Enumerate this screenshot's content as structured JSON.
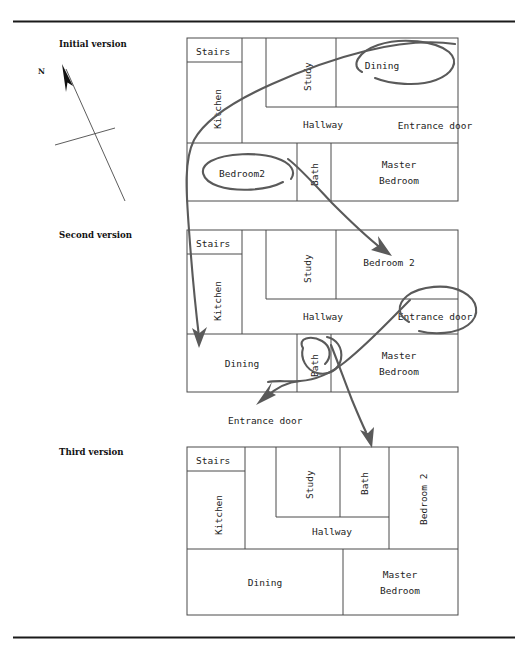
{
  "figure": {
    "compass": {
      "label": "N",
      "name": "north-arrow"
    },
    "versions": [
      {
        "id": "v1",
        "label": "Initial version"
      },
      {
        "id": "v2",
        "label": "Second version"
      },
      {
        "id": "v3",
        "label": "Third version"
      }
    ],
    "plans": {
      "v1": {
        "rooms": [
          {
            "name": "stairs",
            "label": "Stairs",
            "orient": "h"
          },
          {
            "name": "kitchen",
            "label": "Kitchen",
            "orient": "v"
          },
          {
            "name": "study",
            "label": "Study",
            "orient": "v"
          },
          {
            "name": "dining",
            "label": "Dining",
            "orient": "h"
          },
          {
            "name": "hallway",
            "label": "Hallway",
            "orient": "h"
          },
          {
            "name": "entrance-door",
            "label": "Entrance door",
            "orient": "h"
          },
          {
            "name": "bedroom2",
            "label": "Bedroom2",
            "orient": "h"
          },
          {
            "name": "bath",
            "label": "Bath",
            "orient": "v"
          },
          {
            "name": "master-bedroom-1",
            "label": "Master",
            "orient": "h"
          },
          {
            "name": "master-bedroom-2",
            "label": "Bedroom",
            "orient": "h"
          }
        ]
      },
      "v2": {
        "rooms": [
          {
            "name": "stairs",
            "label": "Stairs",
            "orient": "h"
          },
          {
            "name": "kitchen",
            "label": "Kitchen",
            "orient": "v"
          },
          {
            "name": "study",
            "label": "Study",
            "orient": "v"
          },
          {
            "name": "bedroom2",
            "label": "Bedroom 2",
            "orient": "h"
          },
          {
            "name": "hallway",
            "label": "Hallway",
            "orient": "h"
          },
          {
            "name": "entrance-door",
            "label": "Entrance door",
            "orient": "h"
          },
          {
            "name": "dining",
            "label": "Dining",
            "orient": "h"
          },
          {
            "name": "bath",
            "label": "Bath",
            "orient": "v"
          },
          {
            "name": "master-bedroom-1",
            "label": "Master",
            "orient": "h"
          },
          {
            "name": "master-bedroom-2",
            "label": "Bedroom",
            "orient": "h"
          }
        ]
      },
      "v3": {
        "rooms": [
          {
            "name": "stairs",
            "label": "Stairs",
            "orient": "h"
          },
          {
            "name": "kitchen",
            "label": "Kitchen",
            "orient": "v"
          },
          {
            "name": "study",
            "label": "Study",
            "orient": "v"
          },
          {
            "name": "bath",
            "label": "Bath",
            "orient": "v"
          },
          {
            "name": "bedroom2",
            "label": "Bedroom 2",
            "orient": "v"
          },
          {
            "name": "hallway",
            "label": "Hallway",
            "orient": "h"
          },
          {
            "name": "dining",
            "label": "Dining",
            "orient": "h"
          },
          {
            "name": "master-bedroom-1",
            "label": "Master",
            "orient": "h"
          },
          {
            "name": "master-bedroom-2",
            "label": "Bedroom",
            "orient": "h"
          }
        ]
      }
    },
    "annotations": [
      {
        "name": "entrance-door-callout",
        "label": "Entrance door"
      }
    ],
    "ink_marks": [
      {
        "name": "dining-circle-v1",
        "kind": "ellipse-lasso"
      },
      {
        "name": "bedroom2-circle-v1",
        "kind": "spiral-lasso"
      },
      {
        "name": "bath-circle-v2",
        "kind": "spiral-lasso"
      },
      {
        "name": "entrance-door-circle-v2",
        "kind": "ellipse-lasso"
      },
      {
        "name": "dining-move-arrow",
        "kind": "arrow"
      },
      {
        "name": "bedroom2-move-arrow",
        "kind": "arrow"
      },
      {
        "name": "entrance-door-move-arrow",
        "kind": "arrow"
      },
      {
        "name": "bath-move-arrow",
        "kind": "arrow"
      }
    ],
    "colors": {
      "ink": "#5a5a5a",
      "wall": "#4a4a4a",
      "text": "#1d1d1d",
      "rule": "#1a1a1a"
    }
  }
}
